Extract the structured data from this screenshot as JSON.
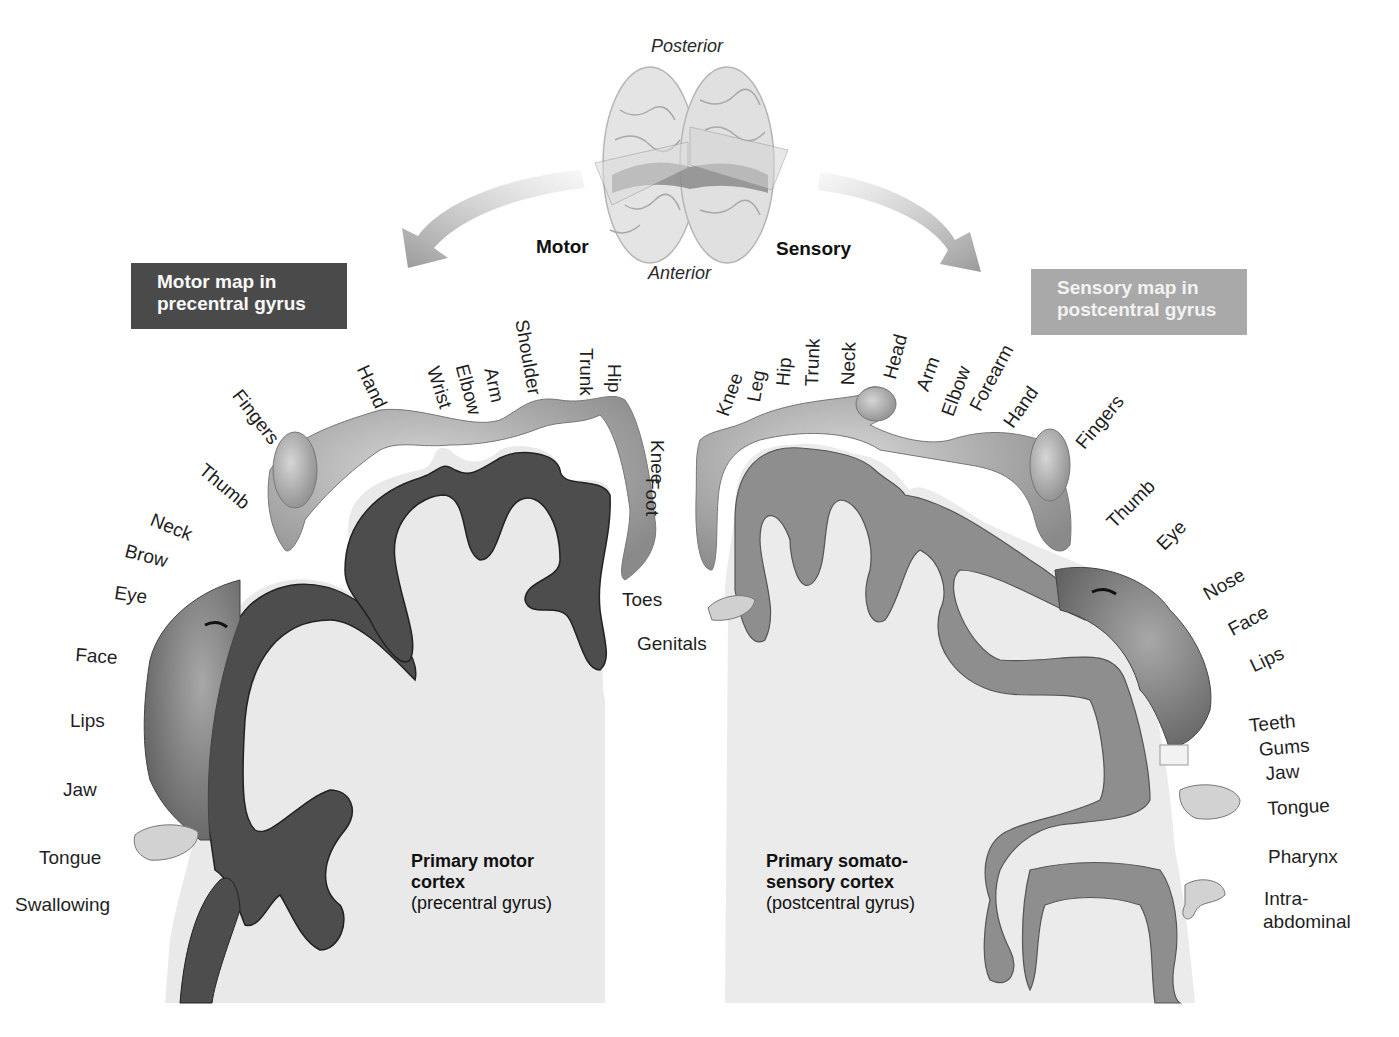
{
  "orientation": {
    "posterior": "Posterior",
    "anterior": "Anterior"
  },
  "arrows": {
    "motor": "Motor",
    "sensory": "Sensory"
  },
  "map_titles": {
    "motor_line1": "Motor map in",
    "motor_line2": "precentral gyrus",
    "sensory_line1": "Sensory map in",
    "sensory_line2": "postcentral gyrus"
  },
  "cortex_labels": {
    "motor_title_line1": "Primary motor",
    "motor_title_line2": "cortex",
    "motor_subtitle": "(precentral gyrus)",
    "sensory_title_line1": "Primary somato-",
    "sensory_title_line2": "sensory cortex",
    "sensory_subtitle": "(postcentral gyrus)"
  },
  "motor_homunculus": {
    "labels": [
      "Toes",
      "Foot",
      "Knee",
      "Hip",
      "Trunk",
      "Shoulder",
      "Arm",
      "Elbow",
      "Wrist",
      "Hand",
      "Fingers",
      "Thumb",
      "Neck",
      "Brow",
      "Eye",
      "Face",
      "Lips",
      "Jaw",
      "Tongue",
      "Swallowing"
    ]
  },
  "sensory_homunculus": {
    "labels": [
      "Genitals",
      "Knee",
      "Leg",
      "Hip",
      "Trunk",
      "Neck",
      "Head",
      "Arm",
      "Elbow",
      "Forearm",
      "Hand",
      "Fingers",
      "Thumb",
      "Eye",
      "Nose",
      "Face",
      "Lips",
      "Teeth",
      "Gums",
      "Jaw",
      "Tongue",
      "Pharynx",
      "Intra-",
      "abdominal"
    ]
  },
  "colors": {
    "motor_cortex_gray_matter": "#4d4d4d",
    "sensory_cortex_gray_matter": "#8e8e8e",
    "white_matter": "#e6e6e6",
    "motor_box": "#4a4a4a",
    "sensory_box": "#a9a9a9",
    "arrow": "#9a9a9a"
  }
}
